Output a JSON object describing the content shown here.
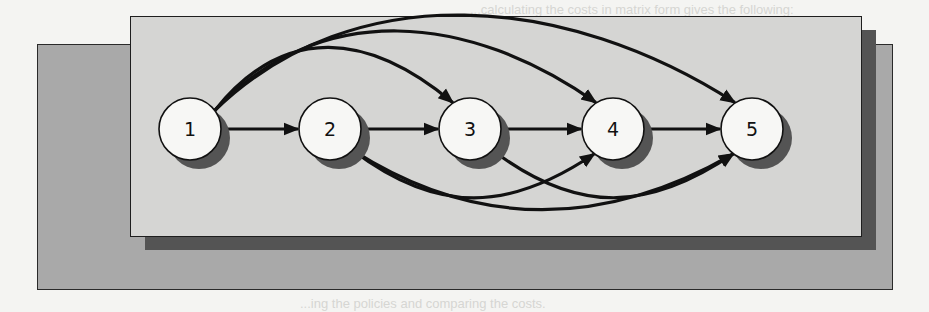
{
  "background_text": {
    "top_line": "...calculating the costs in matrix form gives the following:",
    "bottom_line": "...ing the policies and comparing the costs."
  },
  "colors": {
    "page": "#f4f4f2",
    "outer_frame": "#a9a9a9",
    "panel": "#d5d5d3",
    "shadow": "#545454",
    "node_fill": "#f7f7f5",
    "edge": "#111111"
  },
  "diagram": {
    "type": "directed-graph",
    "nodes": [
      {
        "id": "1",
        "label": "1",
        "cx": 190,
        "cy": 129
      },
      {
        "id": "2",
        "label": "2",
        "cx": 330,
        "cy": 129
      },
      {
        "id": "3",
        "label": "3",
        "cx": 470,
        "cy": 129
      },
      {
        "id": "4",
        "label": "4",
        "cx": 613,
        "cy": 129
      },
      {
        "id": "5",
        "label": "5",
        "cx": 752,
        "cy": 129
      }
    ],
    "edges": [
      {
        "from": "1",
        "to": "2",
        "route": "straight"
      },
      {
        "from": "2",
        "to": "3",
        "route": "straight"
      },
      {
        "from": "3",
        "to": "4",
        "route": "straight"
      },
      {
        "from": "4",
        "to": "5",
        "route": "straight"
      },
      {
        "from": "1",
        "to": "3",
        "route": "arc-top"
      },
      {
        "from": "1",
        "to": "4",
        "route": "arc-top"
      },
      {
        "from": "1",
        "to": "5",
        "route": "arc-top"
      },
      {
        "from": "2",
        "to": "4",
        "route": "arc-bottom"
      },
      {
        "from": "2",
        "to": "5",
        "route": "arc-bottom"
      },
      {
        "from": "3",
        "to": "5",
        "route": "arc-bottom"
      }
    ]
  }
}
